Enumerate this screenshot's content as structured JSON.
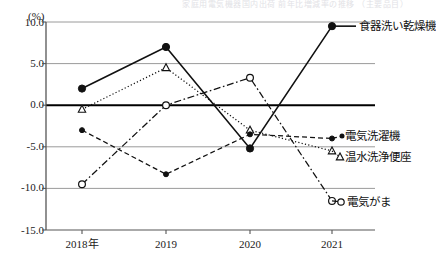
{
  "top_crop_text": "家庭用電気機器国内出荷 前年比増減率の推移 （主要品目）",
  "chart_data": {
    "type": "line",
    "title": "",
    "subtitle": "",
    "xlabel": "",
    "ylabel": "",
    "unit_label": "(%)",
    "categories": [
      "2018年",
      "2019",
      "2020",
      "2021"
    ],
    "ylim": [
      -15.0,
      10.0
    ],
    "ytick_labels": [
      "10.0",
      "5.0",
      "0.0",
      "-5.0",
      "-10.0",
      "-15.0"
    ],
    "ytick_values": [
      10.0,
      5.0,
      0.0,
      -5.0,
      -10.0,
      -15.0
    ],
    "grid": true,
    "zero_line": 0.0,
    "legend_position": "inline-right",
    "series": [
      {
        "name": "食器洗い乾燥機",
        "values": [
          2.0,
          7.0,
          -5.2,
          9.5
        ],
        "line_style": "solid",
        "marker": "filled-circle",
        "color": "#111111"
      },
      {
        "name": "温水洗浄便座",
        "values": [
          -0.5,
          4.5,
          -3.0,
          -5.5
        ],
        "line_style": "dotted",
        "marker": "open-triangle",
        "color": "#111111"
      },
      {
        "name": "電気洗濯機",
        "values": [
          -3.0,
          -8.3,
          -3.5,
          -4.0
        ],
        "line_style": "dashed",
        "marker": "filled-diamond",
        "color": "#111111"
      },
      {
        "name": "電気がま",
        "values": [
          -9.5,
          0.0,
          3.3,
          -11.5
        ],
        "line_style": "dash-dot",
        "marker": "open-circle",
        "color": "#111111"
      }
    ]
  },
  "annotations": {
    "label_dishwasher": "食器洗い乾燥機",
    "label_washer": "電気洗濯機",
    "label_washlet": "温水洗浄便座",
    "label_ricecooker": "電気がま"
  }
}
